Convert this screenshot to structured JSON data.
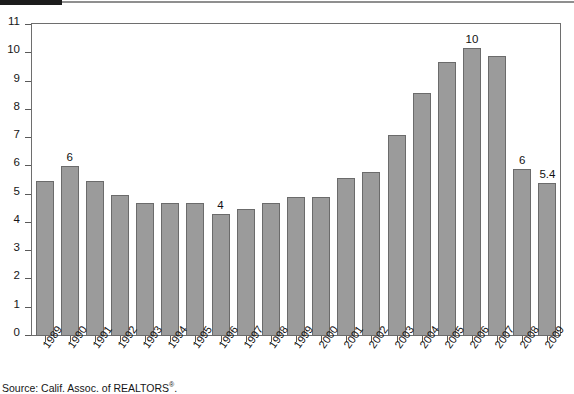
{
  "decoration": {
    "top_bar_color": "#1c1c1c",
    "top_rule_color": "#8f8f8f"
  },
  "source": {
    "prefix": "Source: Calif. Assoc. of REALTORS",
    "registered_mark": "®",
    "suffix": "."
  },
  "style": {
    "bar_fill": "#9b9b9b",
    "bar_stroke": "#6b6b6b",
    "frame_stroke": "#6e6e6e",
    "text_color": "#111111"
  },
  "chart_data": {
    "type": "bar",
    "title": "",
    "xlabel": "",
    "ylabel": "",
    "ylim": [
      0,
      11
    ],
    "ytick_step": 1,
    "yticks": [
      11,
      10,
      9,
      8,
      7,
      6,
      5,
      4,
      3,
      2,
      1,
      0
    ],
    "grid": false,
    "legend": "none",
    "categories": [
      "1989",
      "1990",
      "1991",
      "1992",
      "1993",
      "1994",
      "1995",
      "1996",
      "1997",
      "1998",
      "1999",
      "2000",
      "2001",
      "2002",
      "2003",
      "2004",
      "2005",
      "2006",
      "2007",
      "2008",
      "2009"
    ],
    "values": [
      5.5,
      6.0,
      5.5,
      5.0,
      4.7,
      4.7,
      4.7,
      4.3,
      4.5,
      4.7,
      4.9,
      4.9,
      5.6,
      5.8,
      7.1,
      8.6,
      9.7,
      10.2,
      9.9,
      5.9,
      5.4
    ],
    "point_labels": [
      "",
      "6",
      "",
      "",
      "",
      "",
      "",
      "4",
      "",
      "",
      "",
      "",
      "",
      "",
      "",
      "",
      "",
      "10",
      "",
      "6",
      "5.4"
    ]
  }
}
